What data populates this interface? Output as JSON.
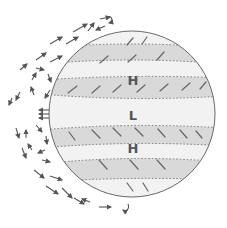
{
  "diagram": {
    "type": "planetary atmospheric circulation",
    "labels": {
      "high_north": "H",
      "low_equator": "L",
      "high_south": "H"
    },
    "colors": {
      "background": "#ffffff",
      "planet_fill": "#f2f2f2",
      "band_fill": "#d9d9d9",
      "outline": "#6a6a6a",
      "arrow": "#555555",
      "dotted_line": "#777777"
    },
    "bands": [
      {
        "name": "north-subtropical-band",
        "shaded": true
      },
      {
        "name": "north-high-zone",
        "shaded": false,
        "label": "H"
      },
      {
        "name": "north-trade-band",
        "shaded": true
      },
      {
        "name": "equatorial-low-zone",
        "shaded": false,
        "label": "L"
      },
      {
        "name": "south-trade-band",
        "shaded": true
      },
      {
        "name": "south-high-zone",
        "shaded": false,
        "label": "H"
      },
      {
        "name": "south-subtropical-band",
        "shaded": true
      }
    ],
    "circulation_cells": [
      "hadley-cell-north",
      "hadley-cell-south",
      "outer-flow-north",
      "outer-flow-south"
    ]
  }
}
